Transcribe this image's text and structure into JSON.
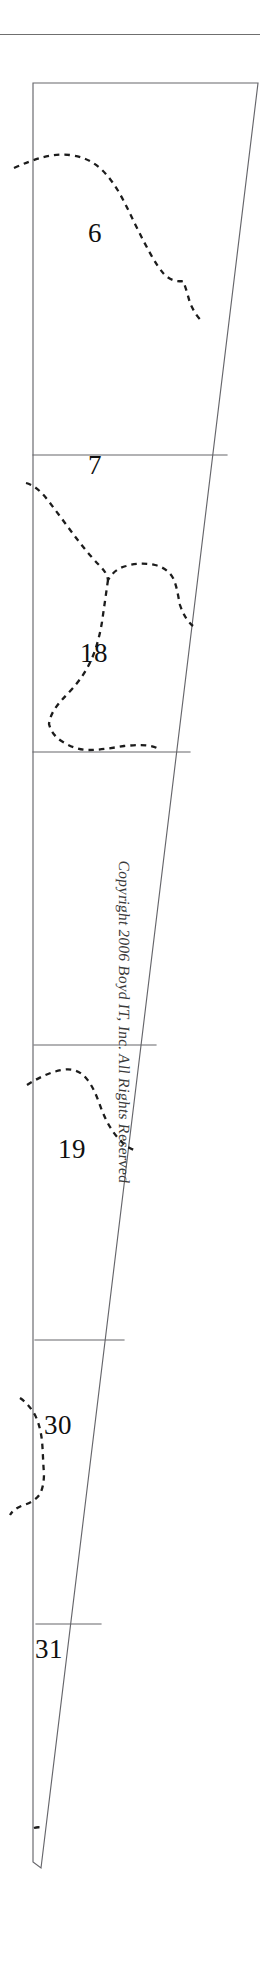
{
  "document": {
    "title": "Parcel Strip Plat",
    "page_background": "#ffffff",
    "width": 260,
    "height": 1963
  },
  "top_rule": {
    "name": "horizontal-rule",
    "color": "#6f6f6f"
  },
  "copyright": {
    "text": "Copyright 2006 Boyd IT, Inc. All Rights Reserved",
    "orientation": "vertical-rotated-90",
    "color": "#3a3a3a"
  },
  "styles": {
    "solid_line_color": "#66666b",
    "dashed_line_color": "#1c1c1c",
    "label_color": "#101010"
  },
  "plat": {
    "outline_name": "parcel-strip-outline",
    "description": "Tapering quadrilateral strip divided by horizontal lines into numbered parcels",
    "outline_points": "33,83 258,83 41,1868 33,1862",
    "dividers": [
      {
        "name": "divider-6-7",
        "points": "33,455 227,455"
      },
      {
        "name": "divider-7-18",
        "points": "33,752 190,752"
      },
      {
        "name": "divider-18-19",
        "points": "34,1045 156,1045"
      },
      {
        "name": "divider-19-30",
        "points": "35,1340 124,1340"
      },
      {
        "name": "divider-30-31",
        "points": "36,1624 101,1624"
      }
    ]
  },
  "parcels": [
    {
      "id": "parcel-6",
      "label": "6",
      "x": 88,
      "y": 220
    },
    {
      "id": "parcel-7",
      "label": "7",
      "x": 88,
      "y": 452
    },
    {
      "id": "parcel-18",
      "label": "18",
      "x": 80,
      "y": 640
    },
    {
      "id": "parcel-19",
      "label": "19",
      "x": 58,
      "y": 1136
    },
    {
      "id": "parcel-30",
      "label": "30",
      "x": 44,
      "y": 1412
    },
    {
      "id": "parcel-31",
      "label": "31",
      "x": 35,
      "y": 1636
    }
  ],
  "dashed_boundaries": [
    {
      "name": "dashed-boundary-6",
      "path": "M 14,168 C 34,159 52,153 70,155 C 88,157 100,166 110,179 C 121,193 128,210 136,226 C 146,246 155,264 164,274 C 170,280 176,282 183,281 C 186,288 188,296 190,303 C 194,312 198,318 203,322"
    },
    {
      "name": "dashed-boundary-7",
      "path": "M 26,483 C 34,485 42,492 50,503 C 60,516 70,530 80,543 C 88,553 94,560 100,566 C 104,570 107,574 108,580 C 112,573 118,568 126,566 C 136,563 146,563 155,565 C 163,567 169,571 173,578 C 177,586 178,596 180,605 C 183,614 187,621 193,626"
    },
    {
      "name": "dashed-boundary-18",
      "path": "M 108,580 C 106,594 104,608 102,622 C 99,640 94,657 86,670 C 78,684 68,693 60,702 C 54,709 50,716 49,724 C 51,732 56,738 63,742 C 71,747 80,750 89,750 C 100,750 112,748 124,746 C 136,745 148,744 157,748"
    },
    {
      "name": "dashed-boundary-19",
      "path": "M 27,1085 C 38,1078 50,1072 62,1070 C 72,1068 80,1071 86,1078 C 93,1086 97,1097 101,1108 C 106,1121 112,1132 120,1140 C 124,1145 129,1148 134,1150"
    },
    {
      "name": "dashed-boundary-30",
      "path": "M 20,1398 C 26,1402 31,1408 35,1415 C 39,1423 41,1432 42,1441 C 43,1452 43,1463 44,1473 C 44,1481 43,1488 40,1494 C 36,1500 30,1503 24,1505 C 18,1507 13,1510 10,1515"
    },
    {
      "name": "dashed-boundary-31",
      "path": "M 34,1828 C 37,1827 40,1827 42,1828"
    }
  ]
}
